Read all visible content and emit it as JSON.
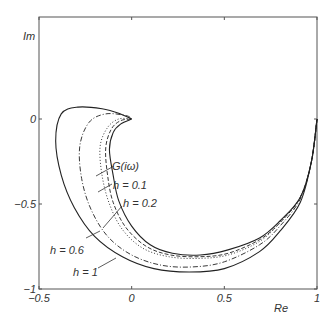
{
  "chart_data": {
    "type": "line",
    "title": "",
    "xlabel": "Re",
    "ylabel": "Im",
    "xlim": [
      -0.5,
      1
    ],
    "ylim": [
      -1,
      0.6
    ],
    "grid": false,
    "x_ticks": [
      "-0.5",
      "0",
      "0.5",
      "1"
    ],
    "y_ticks": [
      "-1",
      "-0.5",
      "0"
    ],
    "series": [
      {
        "name": "G(iω)",
        "style": "solid",
        "x": [
          1,
          0.97,
          0.91,
          0.8,
          0.69,
          0.52,
          0.37,
          0.22,
          0.1,
          0.0,
          -0.07,
          -0.1,
          -0.12,
          -0.1,
          -0.06,
          0
        ],
        "y": [
          0,
          -0.25,
          -0.46,
          -0.6,
          -0.7,
          -0.77,
          -0.8,
          -0.79,
          -0.74,
          -0.63,
          -0.48,
          -0.33,
          -0.18,
          -0.08,
          -0.03,
          0
        ]
      },
      {
        "name": "h = 0.1",
        "style": "dashed",
        "x": [
          1,
          0.97,
          0.91,
          0.8,
          0.69,
          0.52,
          0.37,
          0.21,
          0.08,
          -0.03,
          -0.1,
          -0.13,
          -0.14,
          -0.11,
          -0.06,
          0
        ],
        "y": [
          0,
          -0.25,
          -0.46,
          -0.61,
          -0.71,
          -0.79,
          -0.81,
          -0.8,
          -0.75,
          -0.64,
          -0.49,
          -0.33,
          -0.17,
          -0.06,
          -0.01,
          0
        ]
      },
      {
        "name": "h = 0.2",
        "style": "dotted",
        "x": [
          1,
          0.97,
          0.91,
          0.8,
          0.69,
          0.52,
          0.36,
          0.2,
          0.06,
          -0.05,
          -0.12,
          -0.16,
          -0.17,
          -0.13,
          -0.07,
          0
        ],
        "y": [
          0,
          -0.25,
          -0.46,
          -0.61,
          -0.72,
          -0.8,
          -0.82,
          -0.81,
          -0.76,
          -0.65,
          -0.5,
          -0.33,
          -0.16,
          -0.05,
          0.0,
          0
        ]
      },
      {
        "name": "h = 0.6",
        "style": "dashdot",
        "x": [
          1,
          0.97,
          0.91,
          0.8,
          0.69,
          0.5,
          0.33,
          0.16,
          0.0,
          -0.13,
          -0.22,
          -0.27,
          -0.28,
          -0.23,
          -0.14,
          -0.03,
          0
        ],
        "y": [
          0,
          -0.25,
          -0.47,
          -0.63,
          -0.74,
          -0.84,
          -0.87,
          -0.86,
          -0.8,
          -0.69,
          -0.53,
          -0.35,
          -0.16,
          -0.02,
          0.03,
          0.02,
          0
        ]
      },
      {
        "name": "h = 1",
        "style": "solid",
        "x": [
          1,
          0.97,
          0.91,
          0.8,
          0.69,
          0.5,
          0.31,
          0.12,
          -0.05,
          -0.2,
          -0.31,
          -0.38,
          -0.41,
          -0.38,
          -0.29,
          -0.16,
          -0.06,
          0
        ],
        "y": [
          0,
          -0.25,
          -0.49,
          -0.66,
          -0.78,
          -0.88,
          -0.9,
          -0.88,
          -0.81,
          -0.69,
          -0.52,
          -0.33,
          -0.13,
          0.03,
          0.07,
          0.06,
          0.03,
          0
        ]
      }
    ],
    "annotations": [
      {
        "text": "G(iω)",
        "x": 0.06,
        "y": -0.3
      },
      {
        "text": "h = 0.1",
        "x": 0.1,
        "y": -0.4
      },
      {
        "text": "h = 0.2",
        "x": 0.2,
        "y": -0.5
      },
      {
        "text": "h = 0.6",
        "x": -0.37,
        "y": -0.71
      },
      {
        "text": "h = 1",
        "x": -0.16,
        "y": -0.87
      }
    ]
  },
  "axes": {
    "xlabel": "Re",
    "ylabel": "Im",
    "x_ticks": [
      {
        "label": "-0.5",
        "value": -0.5
      },
      {
        "label": "0",
        "value": 0
      },
      {
        "label": "0.5",
        "value": 0.5
      },
      {
        "label": "1",
        "value": 1
      }
    ],
    "y_ticks": [
      {
        "label": "-1",
        "value": -1
      },
      {
        "label": "-0.5",
        "value": -0.5
      },
      {
        "label": "0",
        "value": 0
      }
    ]
  },
  "labels": {
    "g": "G(iω)",
    "h01": "h = 0.1",
    "h02": "h = 0.2",
    "h06": "h = 0.6",
    "h1": "h = 1"
  }
}
